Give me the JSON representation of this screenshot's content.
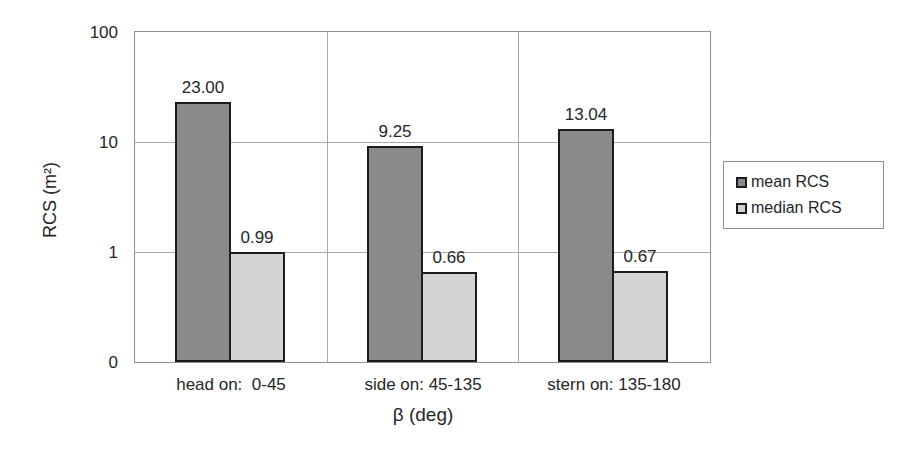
{
  "chart_data": {
    "type": "bar",
    "y_scale": "log",
    "categories": [
      "head on:  0-45",
      "side on: 45-135",
      "stern on: 135-180"
    ],
    "series": [
      {
        "name": "mean RCS",
        "values": [
          23.0,
          9.25,
          13.04
        ],
        "labels": [
          "23.00",
          "9.25",
          "13.04"
        ],
        "color": "#8a8a8a"
      },
      {
        "name": "median RCS",
        "values": [
          0.99,
          0.66,
          0.67
        ],
        "labels": [
          "0.99",
          "0.66",
          "0.67"
        ],
        "color": "#d4d4d4"
      }
    ],
    "title": "",
    "xlabel": "β (deg)",
    "ylabel": "RCS (m²)",
    "ylim": [
      0.1,
      100
    ],
    "yticks": [
      {
        "value": 100,
        "label": "100"
      },
      {
        "value": 10,
        "label": "10"
      },
      {
        "value": 1,
        "label": "1"
      },
      {
        "value": 0.1,
        "label": "0"
      }
    ],
    "grid": true,
    "legend_position": "right"
  },
  "colors": {
    "mean_bar": "#8a8a8a",
    "median_bar": "#d4d4d4",
    "bar_border": "#1c1c1c",
    "gridline": "#a9a9a9",
    "plot_border": "#8f8f8f",
    "text": "#262626"
  }
}
